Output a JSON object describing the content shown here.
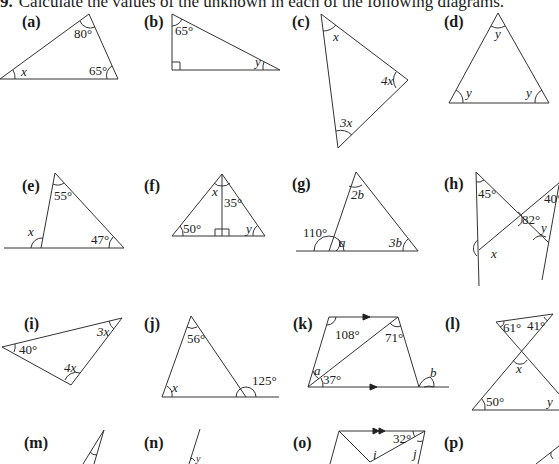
{
  "heading": {
    "number": "9.",
    "text": "Calculate the values of the unknown in each of the following diagrams."
  },
  "problems": {
    "a": {
      "label": "(a)",
      "angles": {
        "top": "80°",
        "right": "65°",
        "left": "x"
      }
    },
    "b": {
      "label": "(b)",
      "angles": {
        "top": "65°",
        "right": "y"
      }
    },
    "c": {
      "label": "(c)",
      "angles": {
        "top": "x",
        "right": "4x",
        "bottom": "3x"
      }
    },
    "d": {
      "label": "(d)",
      "angles": {
        "top": "y",
        "left": "y",
        "right": "y"
      }
    },
    "e": {
      "label": "(e)",
      "angles": {
        "top": "55°",
        "right": "47°",
        "exterior": "x"
      }
    },
    "f": {
      "label": "(f)",
      "angles": {
        "apex_left": "x",
        "apex_right": "35°",
        "left": "50°",
        "right": "y"
      }
    },
    "g": {
      "label": "(g)",
      "angles": {
        "top": "2b",
        "right": "3b",
        "exterior": "110°",
        "interior": "a"
      }
    },
    "h": {
      "label": "(h)",
      "angles": {
        "top_left": "45°",
        "top_right": "40°",
        "center": "82°",
        "right": "y",
        "left": "x"
      }
    },
    "i": {
      "label": "(i)",
      "angles": {
        "left": "40°",
        "right": "3x",
        "bottom": "4x"
      }
    },
    "j": {
      "label": "(j)",
      "angles": {
        "top": "56°",
        "left": "x",
        "exterior": "125°"
      }
    },
    "k": {
      "label": "(k)",
      "angles": {
        "top_left": "108°",
        "top_right": "71°",
        "bottom_left_upper": "a",
        "bottom_left_lower": "37°",
        "exterior": "b"
      }
    },
    "l": {
      "label": "(l)",
      "angles": {
        "top_left": "61°",
        "top_right": "41°",
        "center": "x",
        "bottom_left": "50°",
        "bottom_right": "y"
      }
    },
    "m": {
      "label": "(m)"
    },
    "n": {
      "label": "(n)",
      "angles": {
        "top": "y"
      }
    },
    "o": {
      "label": "(o)",
      "angles": {
        "top_right": "32°",
        "inner": "i",
        "right": "j"
      }
    },
    "p": {
      "label": "(p)"
    }
  }
}
